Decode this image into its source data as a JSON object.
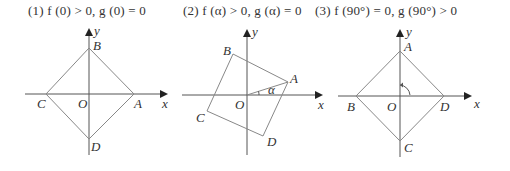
{
  "panels": [
    {
      "title": "(1) f (0) > 0, g (0) = 0",
      "labels": {
        "A": "A",
        "B": "B",
        "C": "C",
        "D": "D",
        "O": "O",
        "x": "x",
        "y": "y"
      }
    },
    {
      "title": "(2) f (α) > 0, g (α) = 0",
      "labels": {
        "A": "A",
        "B": "B",
        "C": "C",
        "D": "D",
        "O": "O",
        "x": "x",
        "y": "y",
        "angle": "α"
      }
    },
    {
      "title": "(3) f (90°) = 0, g (90°) > 0",
      "labels": {
        "A": "A",
        "B": "B",
        "C": "C",
        "D": "D",
        "O": "O",
        "x": "x",
        "y": "y"
      }
    }
  ],
  "colors": {
    "axis": "#555555",
    "square": "#888888",
    "text": "#333333"
  }
}
